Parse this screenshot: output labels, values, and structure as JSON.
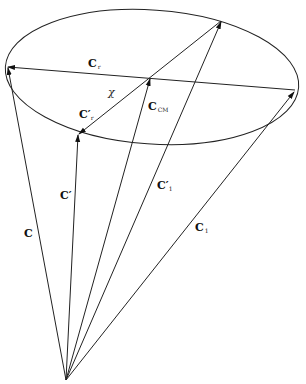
{
  "diagram": {
    "type": "vector-cone",
    "stroke_color": "#222222",
    "apex": [
      66,
      380
    ],
    "ellipse": {
      "cx": 152,
      "cy": 77,
      "rx": 147,
      "ry": 67,
      "rotate": 4
    },
    "labels": {
      "c": {
        "main": "C",
        "sub": ""
      },
      "c_prime": {
        "main": "C′",
        "sub": ""
      },
      "c_cm": {
        "main": "C",
        "sub": "CM"
      },
      "c_prime_1": {
        "main": "C′",
        "sub": "1"
      },
      "c_1": {
        "main": "C",
        "sub": "1"
      },
      "c_r": {
        "main": "C",
        "sub": "r"
      },
      "c_prime_r": {
        "main": "C′",
        "sub": "r"
      },
      "chi": "χ"
    }
  }
}
